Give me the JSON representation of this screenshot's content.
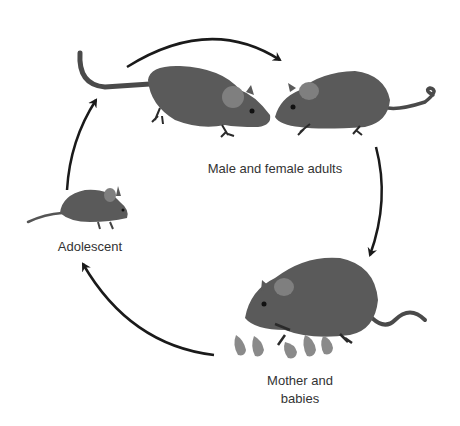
{
  "diagram": {
    "type": "life-cycle",
    "colors": {
      "body": "#5a5a5a",
      "ear": "#7f7f7f",
      "baby": "#8a8a8a",
      "arrow": "#1a1a1a",
      "text": "#333333"
    },
    "stages": [
      {
        "id": "adults",
        "label": "Male and female adults"
      },
      {
        "id": "mother",
        "label_line1": "Mother and",
        "label_line2": "babies"
      },
      {
        "id": "adolescent",
        "label": "Adolescent"
      }
    ],
    "arrows": [
      {
        "from": "adolescent",
        "to": "adults",
        "direction": "up"
      },
      {
        "from": "adults-left",
        "to": "adults-right",
        "direction": "clockwise-top"
      },
      {
        "from": "adults",
        "to": "mother",
        "direction": "down"
      },
      {
        "from": "mother",
        "to": "adolescent",
        "direction": "counterclockwise-bottom"
      }
    ]
  }
}
